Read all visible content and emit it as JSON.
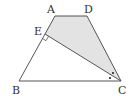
{
  "diagram": {
    "type": "geometry-trapezoid",
    "points": {
      "A": {
        "label": "A",
        "x": 55,
        "y": 16
      },
      "D": {
        "label": "D",
        "x": 87,
        "y": 16
      },
      "E": {
        "label": "E",
        "x": 45,
        "y": 34
      },
      "B": {
        "label": "B",
        "x": 19,
        "y": 81
      },
      "C": {
        "label": "C",
        "x": 121,
        "y": 81
      }
    },
    "labels": {
      "A": "A",
      "D": "D",
      "E": "E",
      "B": "B",
      "C": "C"
    },
    "shaded_region": "AECD",
    "segments": [
      "AD",
      "DC",
      "CB",
      "BA",
      "EC"
    ],
    "annotations": {
      "right_angle_at": "E",
      "equal_angle_marks_at": "C",
      "equal_angle_mark_count": 2
    },
    "colors": {
      "line": "#555555",
      "shade": "#e3e3e3",
      "text": "#333333"
    }
  }
}
